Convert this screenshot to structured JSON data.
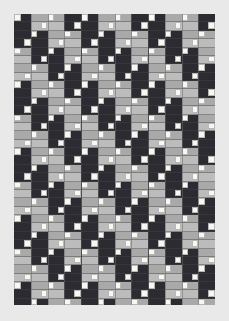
{
  "artwork": {
    "title": "Diagonal Band Quilt Pattern",
    "kind": "textile-quilt-grid",
    "background_color": "#e9e9e9",
    "canvas": {
      "width": 229,
      "height": 321
    },
    "panel": {
      "x": 14,
      "y": 14,
      "width": 201,
      "height": 291
    },
    "palette": {
      "dark": "#2b2b31",
      "mid": "#a9a9a9",
      "light_mid": "#bcbcbc",
      "white": "#f7f7f4",
      "grid_line": "#6a6a6a",
      "block_line": "#3a3a3a",
      "panel_base": "#b9b9b9"
    },
    "grid": {
      "cell_size": 16.75,
      "columns": 12,
      "rows": 18,
      "strips_per_cell": 2,
      "white_square_size": 6.6,
      "block_divider_every_columns": 4
    },
    "bands": {
      "orientation": "diagonal-descending-right",
      "period_cells": 4,
      "sequence": [
        "dark",
        "mid",
        "mid",
        "dark"
      ],
      "description": "Alternating charcoal and gray diagonal stripes running from upper-left to lower-right"
    }
  }
}
